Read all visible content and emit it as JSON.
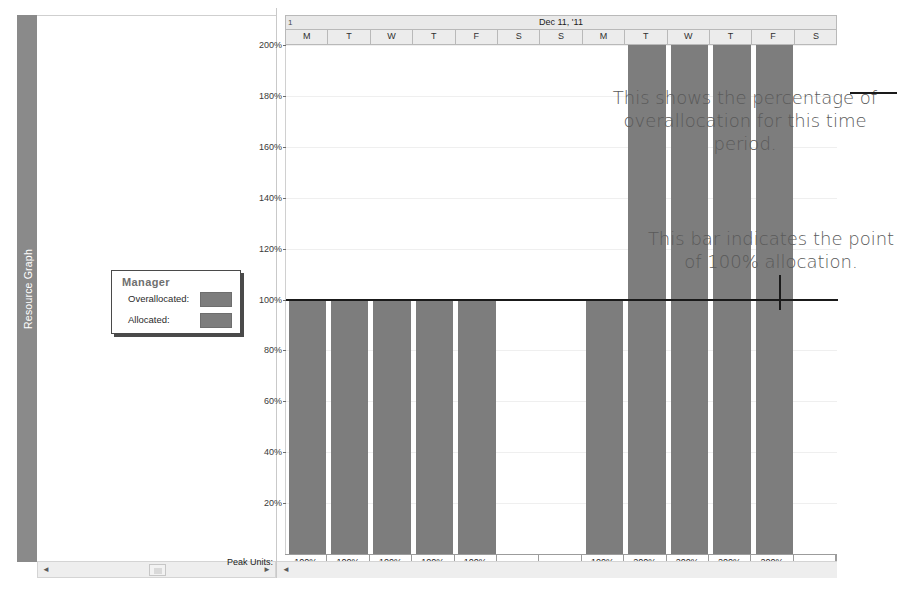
{
  "view": {
    "tab_label": "Resource Graph"
  },
  "legend": {
    "title": "Manager",
    "rows": [
      {
        "label": "Overallocated:",
        "color": "#7d7d7d"
      },
      {
        "label": "Allocated:",
        "color": "#7d7d7d"
      }
    ]
  },
  "timescale": {
    "period_number": "1",
    "date_label": "Dec 11, '11",
    "days": [
      "M",
      "T",
      "W",
      "T",
      "F",
      "S",
      "S",
      "M",
      "T",
      "W",
      "T",
      "F",
      "S"
    ]
  },
  "peak_units": {
    "label": "Peak Units:",
    "values": [
      "100%",
      "100%",
      "100%",
      "100%",
      "100%",
      "",
      "",
      "100%",
      "200%",
      "200%",
      "200%",
      "200%",
      ""
    ]
  },
  "annotations": [
    {
      "text": "This shows the percentage of overallocation for this time period."
    },
    {
      "text": "This bar indicates the point of 100% allocation."
    }
  ],
  "scrollbars": {
    "left_arrow": "◄",
    "right_arrow": "►"
  },
  "chart_data": {
    "type": "bar",
    "title": "",
    "xlabel": "",
    "ylabel": "",
    "categories": [
      "M",
      "T",
      "W",
      "T",
      "F",
      "S",
      "S",
      "M",
      "T",
      "W",
      "T",
      "F",
      "S"
    ],
    "values": [
      100,
      100,
      100,
      100,
      100,
      0,
      0,
      100,
      200,
      200,
      200,
      200,
      0
    ],
    "ylim": [
      0,
      200
    ],
    "yticks": [
      20,
      40,
      60,
      80,
      100,
      120,
      140,
      160,
      180,
      200
    ],
    "ytick_labels": [
      "20%",
      "40%",
      "60%",
      "80%",
      "100%",
      "120%",
      "140%",
      "160%",
      "180%",
      "200%"
    ],
    "grid": true,
    "legend_position": "left-pane",
    "reference_line": {
      "value": 100,
      "label": "100% allocation",
      "color": "#1a1a1a"
    },
    "bar_color": "#7d7d7d",
    "overallocated_color": "#7d7d7d",
    "series": [
      {
        "name": "Allocated",
        "values": [
          100,
          100,
          100,
          100,
          100,
          0,
          0,
          100,
          100,
          100,
          100,
          100,
          0
        ]
      },
      {
        "name": "Overallocated",
        "values": [
          0,
          0,
          0,
          0,
          0,
          0,
          0,
          0,
          100,
          100,
          100,
          100,
          0
        ]
      }
    ]
  }
}
